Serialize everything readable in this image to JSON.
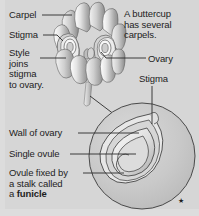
{
  "figure": {
    "background_color": "#d6d6d6",
    "text_color": "#1d1d1d",
    "line_color": "#2b2b2b"
  },
  "labels": {
    "carpel": "Carpel",
    "stigma_left": "Stigma",
    "style": "Style\njoins\nstigma\nto ovary.",
    "note": "A buttercup\nhas several\ncarpels.",
    "ovary": "Ovary",
    "stigma_right": "Stigma",
    "wall_of_ovary": "Wall of ovary",
    "single_ovule": "Single ovule",
    "funicle_line1": "Ovule fixed by",
    "funicle_line2": "a stalk called",
    "funicle_line3_prefix": "a ",
    "funicle_term": "funicle"
  },
  "marks": {
    "footnote_star": "★"
  }
}
